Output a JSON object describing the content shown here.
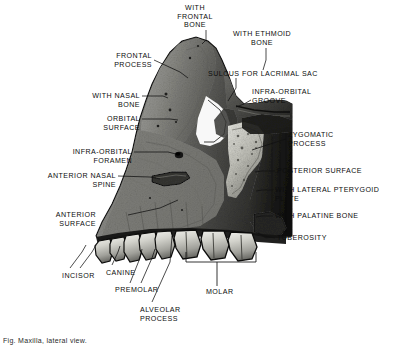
{
  "figure": {
    "title": "Maxilla, lateral view",
    "caption": "Fig. Maxilla, lateral view.",
    "style": "halftone-photograph-black-and-white",
    "background_color": "#ffffff",
    "ink_color": "#0d0d0d"
  },
  "labels": [
    {
      "id": "with-frontal-bone",
      "text": "WITH\nFRONTAL\nBONE",
      "align": "center",
      "x": 195,
      "y": 4
    },
    {
      "id": "with-ethmoid-bone",
      "text": "WITH ETHMOID\nBONE",
      "align": "center",
      "x": 262,
      "y": 30
    },
    {
      "id": "frontal-process",
      "text": "FRONTAL\nPROCESS",
      "align": "right",
      "x": 152,
      "y": 52
    },
    {
      "id": "sulcus-for-lacrimal-sac",
      "text": "SULCUS FOR LACRIMAL SAC",
      "align": "left",
      "x": 208,
      "y": 70
    },
    {
      "id": "with-nasal-bone",
      "text": "WITH NASAL\nBONE",
      "align": "right",
      "x": 140,
      "y": 92
    },
    {
      "id": "infra-orbital-groove",
      "text": "INFRA-ORBITAL\nGROOVE",
      "align": "left",
      "x": 252,
      "y": 88
    },
    {
      "id": "orbital-surface",
      "text": "ORBITAL\nSURFACE",
      "align": "right",
      "x": 140,
      "y": 115
    },
    {
      "id": "zygomatic-process",
      "text": "ZYGOMATIC\nPROCESS",
      "align": "left",
      "x": 288,
      "y": 131
    },
    {
      "id": "infra-orbital-foramen",
      "text": "INFRA-ORBITAL\nFORAMEN",
      "align": "right",
      "x": 132,
      "y": 148
    },
    {
      "id": "posterior-surface",
      "text": "POSTERIOR SURFACE",
      "align": "left",
      "x": 277,
      "y": 167
    },
    {
      "id": "anterior-nasal-spine",
      "text": "ANTERIOR NASAL\nSPINE",
      "align": "right",
      "x": 116,
      "y": 172
    },
    {
      "id": "with-lateral-pterygoid-plate",
      "text": "WITH LATERAL PTERYGOID\nPLATE",
      "align": "left",
      "x": 275,
      "y": 186
    },
    {
      "id": "with-palatine-bone",
      "text": "WITH PALATINE BONE",
      "align": "left",
      "x": 275,
      "y": 212
    },
    {
      "id": "anterior-surface",
      "text": "ANTERIOR\nSURFACE",
      "align": "right",
      "x": 96,
      "y": 211
    },
    {
      "id": "tuberosity",
      "text": "TUBEROSITY",
      "align": "left",
      "x": 277,
      "y": 234
    },
    {
      "id": "incisor",
      "text": "INCISOR",
      "align": "left",
      "x": 62,
      "y": 272
    },
    {
      "id": "canine",
      "text": "CANINE",
      "align": "left",
      "x": 106,
      "y": 269
    },
    {
      "id": "premolar",
      "text": "PREMOLAR",
      "align": "left",
      "x": 115,
      "y": 286
    },
    {
      "id": "molar",
      "text": "MOLAR",
      "align": "left",
      "x": 206,
      "y": 288
    },
    {
      "id": "alveolar-process",
      "text": "ALVEOLAR\nPROCESS",
      "align": "left",
      "x": 140,
      "y": 306
    }
  ],
  "leaders": [
    {
      "id": "leader-with-frontal-bone",
      "points": "206,30 206,40 202,44"
    },
    {
      "id": "leader-with-ethmoid-bone",
      "points": "266,48 266,60 263,70"
    },
    {
      "id": "leader-frontal-process",
      "points": "154,60 180,72 188,78"
    },
    {
      "id": "leader-sulcus-for-lacrimal-sac",
      "points": "236,78 236,88 228,101"
    },
    {
      "id": "leader-with-nasal-bone",
      "points": "142,96 163,96 168,98"
    },
    {
      "id": "leader-infra-orbital-groove",
      "points": "251,100 244,104 236,107"
    },
    {
      "id": "leader-orbital-surface",
      "points": "142,119 170,119 178,120"
    },
    {
      "id": "leader-zygomatic-process",
      "points": "286,139 264,146 252,150"
    },
    {
      "id": "leader-infra-orbital-foramen",
      "points": "134,152 168,152 176,154"
    },
    {
      "id": "leader-posterior-surface",
      "points": "275,171 262,171 255,172"
    },
    {
      "id": "leader-anterior-nasal-spine",
      "points": "118,176 150,177 160,179"
    },
    {
      "id": "leader-with-lateral-pterygoid",
      "points": "273,190 262,190 256,191"
    },
    {
      "id": "leader-with-palatine-bone",
      "points": "273,216 262,216 256,217"
    },
    {
      "id": "leader-anterior-surface",
      "points": "128,215 160,208 178,200"
    },
    {
      "id": "leader-tuberosity",
      "points": "275,238 264,236 258,233"
    },
    {
      "id": "leader-incisor-1",
      "points": "70,268 82,252 86,245"
    },
    {
      "id": "leader-incisor-2",
      "points": "80,268 92,252 96,245"
    },
    {
      "id": "leader-canine",
      "points": "112,265 118,252 120,246"
    },
    {
      "id": "leader-premolar-1",
      "points": "130,283 140,258 142,249"
    },
    {
      "id": "leader-premolar-2",
      "points": "141,283 152,258 155,249"
    },
    {
      "id": "leader-alveolar-process",
      "points": "152,302 170,262 172,236"
    }
  ],
  "brackets": [
    {
      "id": "bracket-molar",
      "x1": 186,
      "x2": 256,
      "y": 262,
      "drop": 10,
      "stem_x": 217,
      "stem_to": 286
    }
  ]
}
